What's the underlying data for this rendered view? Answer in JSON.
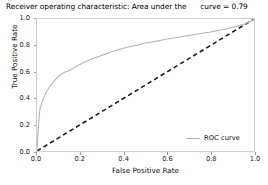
{
  "chart_data": {
    "type": "line",
    "title": "Receiver operating characteristic: Area under the      curve = 0.79",
    "title_main": "Receiver operating characteristic: Area under the",
    "title_auc": "curve = 0.79",
    "auc": 0.79,
    "xlabel": "False Positive Rate",
    "ylabel": "True Positive Rate",
    "xlim": [
      0.0,
      1.0
    ],
    "ylim": [
      0.0,
      1.0
    ],
    "grid": false,
    "legend_position": "lower right",
    "xticks": [
      "0.0",
      "0.2",
      "0.4",
      "0.6",
      "0.8",
      "1.0"
    ],
    "yticks": [
      "0.0",
      "0.2",
      "0.4",
      "0.6",
      "0.8",
      "1.0"
    ],
    "xtick_values": [
      0.0,
      0.2,
      0.4,
      0.6,
      0.8,
      1.0
    ],
    "ytick_values": [
      0.0,
      0.2,
      0.4,
      0.6,
      0.8,
      1.0
    ],
    "series": [
      {
        "name": "ROC curve",
        "style": "solid",
        "color": "#b4b4b4",
        "x": [
          0.0,
          0.004,
          0.008,
          0.01,
          0.012,
          0.014,
          0.016,
          0.018,
          0.02,
          0.024,
          0.028,
          0.032,
          0.036,
          0.04,
          0.046,
          0.052,
          0.058,
          0.064,
          0.07,
          0.078,
          0.086,
          0.094,
          0.102,
          0.112,
          0.122,
          0.132,
          0.144,
          0.156,
          0.168,
          0.182,
          0.196,
          0.21,
          0.226,
          0.242,
          0.258,
          0.276,
          0.294,
          0.312,
          0.332,
          0.352,
          0.372,
          0.394,
          0.416,
          0.438,
          0.462,
          0.486,
          0.51,
          0.536,
          0.562,
          0.588,
          0.616,
          0.644,
          0.672,
          0.702,
          0.732,
          0.762,
          0.794,
          0.826,
          0.858,
          0.892,
          0.926,
          0.96,
          0.98,
          1.0
        ],
        "y": [
          0.0,
          0.12,
          0.215,
          0.26,
          0.292,
          0.318,
          0.336,
          0.344,
          0.352,
          0.372,
          0.392,
          0.408,
          0.424,
          0.438,
          0.456,
          0.472,
          0.486,
          0.5,
          0.512,
          0.528,
          0.542,
          0.556,
          0.568,
          0.582,
          0.592,
          0.6,
          0.606,
          0.616,
          0.628,
          0.642,
          0.654,
          0.666,
          0.678,
          0.69,
          0.7,
          0.712,
          0.722,
          0.732,
          0.744,
          0.756,
          0.766,
          0.776,
          0.786,
          0.794,
          0.802,
          0.812,
          0.82,
          0.828,
          0.836,
          0.844,
          0.852,
          0.86,
          0.868,
          0.876,
          0.884,
          0.892,
          0.9,
          0.91,
          0.92,
          0.932,
          0.948,
          0.964,
          0.978,
          1.0
        ]
      },
      {
        "name": "chance",
        "style": "dashed",
        "color": "#1a1a1a",
        "x": [
          0.0,
          1.0
        ],
        "y": [
          0.0,
          1.0
        ]
      }
    ],
    "legend_entries": [
      {
        "label": "ROC curve",
        "color": "#b4b4b4",
        "style": "solid"
      }
    ]
  }
}
